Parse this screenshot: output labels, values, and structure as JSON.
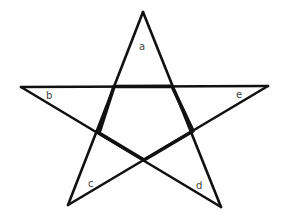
{
  "diagram": {
    "type": "pentagram",
    "stroke_color": "#111111",
    "label_color": "#444444",
    "labels": {
      "a": "a",
      "b": "b",
      "c": "c",
      "d": "d",
      "e": "e"
    }
  }
}
